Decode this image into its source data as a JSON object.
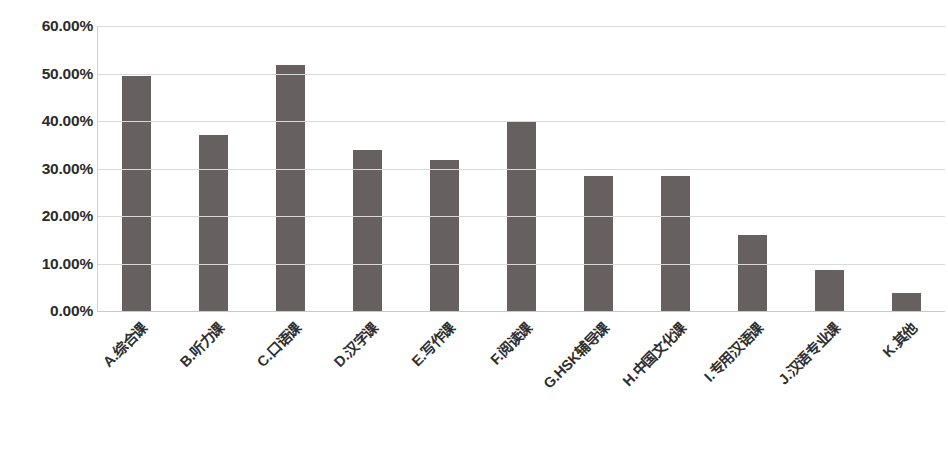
{
  "chart_data": {
    "type": "bar",
    "title": "",
    "xlabel": "",
    "ylabel": "",
    "ylim": [
      0,
      60
    ],
    "grid": true,
    "legend": false,
    "value_suffix": "%",
    "bar_color": "#666160",
    "gridline_color": "#d9d9d9",
    "categories": [
      "A.综合课",
      "B.听力课",
      "C.口语课",
      "D.汉字课",
      "E.写作课",
      "F.阅读课",
      "G.HSK辅导课",
      "H.中国文化课",
      "I.专用汉语课",
      "J.汉语专业课",
      "K.其他"
    ],
    "values": [
      49.4,
      37.0,
      51.8,
      33.8,
      31.7,
      40.1,
      28.5,
      28.5,
      16.1,
      8.6,
      3.8
    ],
    "ytick_labels": [
      "60.00%",
      "50.00%",
      "40.00%",
      "30.00%",
      "20.00%",
      "10.00%",
      "0.00%"
    ],
    "ytick_values": [
      60,
      50,
      40,
      30,
      20,
      10,
      0
    ]
  },
  "caption": {
    "text": ""
  }
}
